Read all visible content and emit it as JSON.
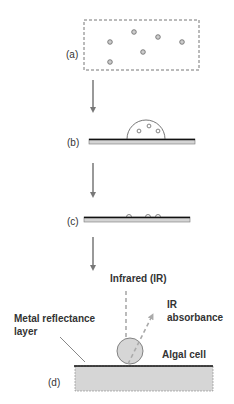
{
  "diagram": {
    "type": "process-steps",
    "colors": {
      "line": "#666666",
      "arrow": "#777777",
      "substrate": "#d4d4d4",
      "metal_layer": "#111111",
      "cell_fill": "#d0d0d0",
      "ir_beam": "#aaaaaa"
    },
    "steps": [
      {
        "label": "(a)",
        "description": "cells suspended in liquid (dashed container)"
      },
      {
        "label": "(b)",
        "description": "droplet with cells deposited on slide"
      },
      {
        "label": "(c)",
        "description": "dried cells on slide"
      },
      {
        "label": "(d)",
        "description": "IR measurement of algal cell on reflective substrate"
      }
    ],
    "annotations": {
      "infrared": "Infrared (IR)",
      "ir_absorbance_line1": "IR",
      "ir_absorbance_line2": "absorbance",
      "metal_layer_line1": "Metal reflectance",
      "metal_layer_line2": "layer",
      "algal_cell": "Algal cell"
    }
  }
}
